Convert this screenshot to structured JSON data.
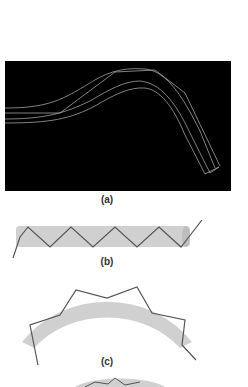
{
  "figure": {
    "panels": [
      {
        "id": "a",
        "label": "(a)",
        "description": "Black panel showing white wireframe of a bent light-guide / fiber bundle curving upward then down"
      },
      {
        "id": "b",
        "label": "(b)",
        "description": "Straight grey cylinder with zig-zag ray bouncing inside, arrows showing direction"
      },
      {
        "id": "c",
        "label": "(c)",
        "description": "Curved grey arc band with zig-zag ray reflecting along its length"
      },
      {
        "id": "d",
        "label": "",
        "description": "Partially visible curved band with ray at bottom edge"
      }
    ],
    "colors": {
      "band": "#d0d0d0",
      "ray": "#555555",
      "panel_bg": "#000000",
      "wire": "#cfcfcf"
    }
  }
}
